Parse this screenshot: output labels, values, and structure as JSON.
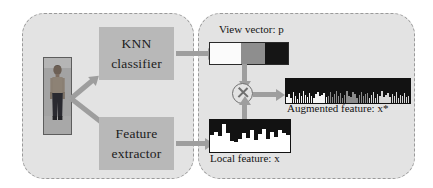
{
  "diagram": {
    "panels": [
      {
        "id": "left",
        "name": "feature-and-view-estimation-panel"
      },
      {
        "id": "right",
        "name": "feature-augmentation-panel"
      }
    ],
    "left_panel": {
      "person_image_alt": "pedestrian-image",
      "boxes": [
        {
          "name": "knn-classifier-box",
          "line1": "KNN",
          "line2": "classifier"
        },
        {
          "name": "feature-extractor-box",
          "line1": "Feature",
          "line2": "extractor"
        }
      ]
    },
    "right_panel": {
      "view_vector_label": "View vector: p",
      "local_feature_label": "Local feature: x",
      "augmented_feature_label": "Augmented feature: x*",
      "operator_symbol": "⊗"
    }
  },
  "chart_data": [
    {
      "type": "bar",
      "name": "view-vector",
      "title": "View vector: p",
      "categories": [
        "front",
        "side",
        "back"
      ],
      "values": [
        0.4,
        0.3,
        0.3
      ],
      "segment_colors": [
        "#fbfbfb",
        "#8e8e8e",
        "#151515"
      ],
      "orientation": "horizontal-stacked",
      "grid": false,
      "legend": "none"
    },
    {
      "type": "bar",
      "name": "local-feature",
      "title": "Local feature: x",
      "xlabel": "",
      "ylabel": "",
      "ylim": [
        0,
        1
      ],
      "grid": false,
      "legend": "none",
      "bar_color": "#ffffff",
      "background_color": "#121212",
      "values": [
        0.52,
        0.62,
        0.5,
        0.88,
        0.58,
        0.33,
        0.3,
        0.4,
        0.58,
        0.44,
        0.68,
        0.36,
        0.55,
        0.72,
        0.4,
        0.63,
        0.48,
        0.7,
        0.58,
        0.52
      ]
    },
    {
      "type": "bar",
      "name": "augmented-feature",
      "title": "Augmented feature: x*",
      "xlabel": "",
      "ylabel": "",
      "ylim": [
        0,
        1
      ],
      "grid": false,
      "legend": "none",
      "background_color": "#121212",
      "series": [
        {
          "name": "front-weighted block",
          "bar_color": "#f5f5f5",
          "values": [
            0.26,
            0.38,
            0.22,
            0.46,
            0.3,
            0.18,
            0.4,
            0.28,
            0.5,
            0.34,
            0.24,
            0.42,
            0.3,
            0.2,
            0.36,
            0.46,
            0.28,
            0.33,
            0.42,
            0.24
          ]
        },
        {
          "name": "side-weighted block",
          "bar_color": "#8c8c8c",
          "values": [
            0.3,
            0.44,
            0.26,
            0.36,
            0.52,
            0.28,
            0.4,
            0.22,
            0.34,
            0.48,
            0.3,
            0.26,
            0.44,
            0.38,
            0.2,
            0.32,
            0.46,
            0.28,
            0.36,
            0.42
          ]
        },
        {
          "name": "back-weighted block",
          "bar_color": "#d8d8d8",
          "values": [
            0.22,
            0.34,
            0.44,
            0.2,
            0.38,
            0.28,
            0.48,
            0.24,
            0.32,
            0.4,
            0.26,
            0.36,
            0.3,
            0.46,
            0.22,
            0.34,
            0.28,
            0.42,
            0.24,
            0.3
          ]
        }
      ]
    }
  ]
}
